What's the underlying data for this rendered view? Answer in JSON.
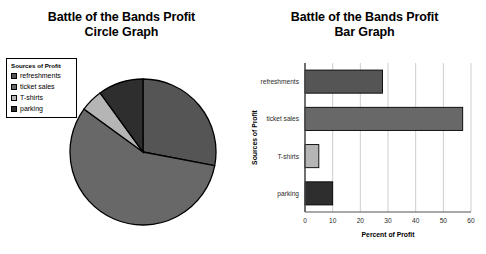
{
  "pie_panel": {
    "title_line1": "Battle of the Bands Profit",
    "title_line2": "Circle Graph",
    "legend_title": "Sources of Profit"
  },
  "bar_panel": {
    "title_line1": "Battle of the Bands Profit",
    "title_line2": "Bar Graph"
  },
  "colors": {
    "refreshments": "#555555",
    "ticket_sales": "#686868",
    "tshirts": "#b5b5b5",
    "parking": "#2e2e2e",
    "outline": "#000000",
    "gridline": "#b9b9b9",
    "axis": "#555555"
  },
  "legend": [
    {
      "label": "refreshments",
      "color": "#555555"
    },
    {
      "label": "ticket sales",
      "color": "#686868"
    },
    {
      "label": "T-shirts",
      "color": "#b5b5b5"
    },
    {
      "label": "parking",
      "color": "#2e2e2e"
    }
  ],
  "chart_data": [
    {
      "type": "pie",
      "title": "Battle of the Bands Profit Circle Graph",
      "legend_title": "Sources of Profit",
      "legend_position": "top-left",
      "categories": [
        "refreshments",
        "ticket sales",
        "T-shirts",
        "parking"
      ],
      "values": [
        28,
        57,
        5,
        10
      ],
      "unit": "percent",
      "colors": [
        "#555555",
        "#686868",
        "#b5b5b5",
        "#2e2e2e"
      ],
      "start_angle_deg": 0,
      "direction": "clockwise"
    },
    {
      "type": "bar",
      "orientation": "horizontal",
      "title": "Battle of the Bands Profit Bar Graph",
      "categories": [
        "refreshments",
        "ticket sales",
        "T-shirts",
        "parking"
      ],
      "values": [
        28,
        57,
        5,
        10
      ],
      "xlabel": "Percent of Profit",
      "ylabel": "Sources of Profit",
      "xlim": [
        0,
        60
      ],
      "xticks": [
        0,
        10,
        20,
        30,
        40,
        50,
        60
      ],
      "xtick_labels": [
        "0",
        "10",
        "20",
        "30",
        "40",
        "50",
        "60"
      ],
      "grid": "vertical",
      "legend": false,
      "colors": [
        "#555555",
        "#686868",
        "#b5b5b5",
        "#2e2e2e"
      ]
    }
  ]
}
